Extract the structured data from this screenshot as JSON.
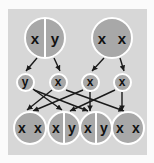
{
  "diagram": {
    "colors": {
      "page_background": "#fbfbfb",
      "panel_background": "#d7d7d7",
      "node_fill": "#a8a8a8",
      "node_outline": "#ffffff",
      "text": "#111111",
      "arrow": "#1a1a1a"
    },
    "parents": [
      {
        "id": "parent-left",
        "label": "x y",
        "alleles": [
          "x",
          "y"
        ],
        "divider": true,
        "cx": 45,
        "cy": 38
      },
      {
        "id": "parent-right",
        "label": "x x",
        "alleles": [
          "x",
          "x"
        ],
        "divider": false,
        "cx": 112,
        "cy": 38
      }
    ],
    "gametes": [
      {
        "id": "gamete-1",
        "label": "y",
        "cx": 25,
        "cy": 82
      },
      {
        "id": "gamete-2",
        "label": "x",
        "cx": 58,
        "cy": 82
      },
      {
        "id": "gamete-3",
        "label": "x",
        "cx": 90,
        "cy": 82
      },
      {
        "id": "gamete-4",
        "label": "x",
        "cx": 122,
        "cy": 82
      }
    ],
    "offspring": [
      {
        "id": "offspring-1",
        "label": "x x",
        "alleles": [
          "x",
          "x"
        ],
        "divider": false,
        "cx": 30,
        "cy": 128
      },
      {
        "id": "offspring-2",
        "label": "x y",
        "alleles": [
          "x",
          "y"
        ],
        "divider": true,
        "cx": 64,
        "cy": 128
      },
      {
        "id": "offspring-3",
        "label": "x y",
        "alleles": [
          "x",
          "y"
        ],
        "divider": true,
        "cx": 96,
        "cy": 128
      },
      {
        "id": "offspring-4",
        "label": "x x",
        "alleles": [
          "x",
          "x"
        ],
        "divider": false,
        "cx": 128,
        "cy": 128
      }
    ],
    "edges": [
      {
        "id": "edge-pl-g1",
        "from": "parent-left",
        "to": "gamete-1",
        "x1": 37,
        "y1": 58,
        "x2": 26,
        "y2": 71
      },
      {
        "id": "edge-pl-g2",
        "from": "parent-left",
        "to": "gamete-2",
        "x1": 54,
        "y1": 58,
        "x2": 60,
        "y2": 71
      },
      {
        "id": "edge-pr-g3",
        "from": "parent-right",
        "to": "gamete-3",
        "x1": 104,
        "y1": 58,
        "x2": 92,
        "y2": 71
      },
      {
        "id": "edge-pr-g4",
        "from": "parent-right",
        "to": "gamete-4",
        "x1": 120,
        "y1": 58,
        "x2": 124,
        "y2": 71
      },
      {
        "id": "edge-g1-o2",
        "from": "gamete-1",
        "to": "offspring-2",
        "x1": 33,
        "y1": 89,
        "x2": 62,
        "y2": 110
      },
      {
        "id": "edge-g1-o3",
        "from": "gamete-1",
        "to": "offspring-3",
        "x1": 34,
        "y1": 90,
        "x2": 88,
        "y2": 111
      },
      {
        "id": "edge-g2-o1",
        "from": "gamete-2",
        "to": "offspring-1",
        "x1": 52,
        "y1": 90,
        "x2": 27,
        "y2": 110
      },
      {
        "id": "edge-g2-o4",
        "from": "gamete-2",
        "to": "offspring-4",
        "x1": 66,
        "y1": 90,
        "x2": 124,
        "y2": 111
      },
      {
        "id": "edge-g3-o1",
        "from": "gamete-3",
        "to": "offspring-1",
        "x1": 83,
        "y1": 90,
        "x2": 33,
        "y2": 111
      },
      {
        "id": "edge-g3-o3",
        "from": "gamete-3",
        "to": "offspring-3",
        "x1": 90,
        "y1": 92,
        "x2": 90,
        "y2": 111
      },
      {
        "id": "edge-g4-o2",
        "from": "gamete-4",
        "to": "offspring-2",
        "x1": 115,
        "y1": 90,
        "x2": 70,
        "y2": 111
      },
      {
        "id": "edge-g4-o4",
        "from": "gamete-4",
        "to": "offspring-4",
        "x1": 122,
        "y1": 92,
        "x2": 122,
        "y2": 111
      }
    ]
  }
}
